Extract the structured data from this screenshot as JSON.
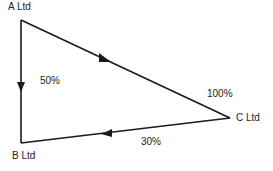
{
  "diagram": {
    "type": "ownership-triangle",
    "nodes": [
      {
        "id": "A",
        "label": "A Ltd"
      },
      {
        "id": "B",
        "label": "B Ltd"
      },
      {
        "id": "C",
        "label": "C Ltd"
      }
    ],
    "edges": [
      {
        "from": "A",
        "to": "B",
        "label": "50%"
      },
      {
        "from": "A",
        "to": "C",
        "label": "100%"
      },
      {
        "from": "C",
        "to": "B",
        "label": "30%"
      }
    ],
    "colors": {
      "line": "#1a1a1a",
      "text": "#222222",
      "background": "#ffffff"
    }
  }
}
